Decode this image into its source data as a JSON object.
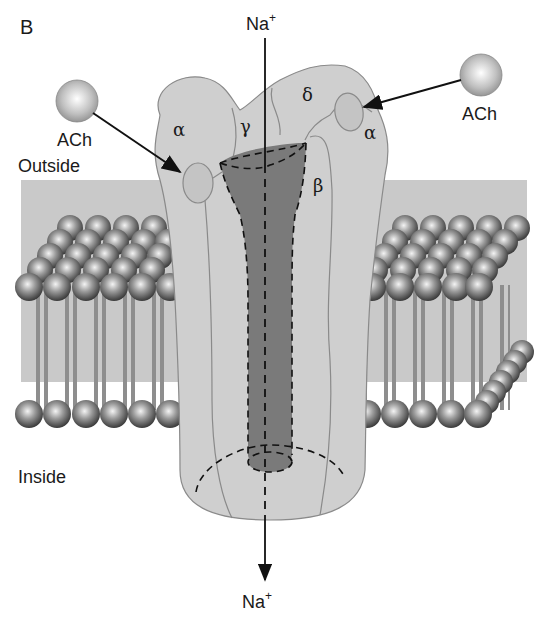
{
  "figure": {
    "panel_label": "B",
    "ion_top": {
      "base": "Na",
      "charge": "+"
    },
    "ion_bottom": {
      "base": "Na",
      "charge": "+"
    },
    "ligand_left": "ACh",
    "ligand_right": "ACh",
    "region_outside": "Outside",
    "region_inside": "Inside"
  },
  "subunits": {
    "alpha_left": "α",
    "gamma": "γ",
    "delta": "δ",
    "alpha_right": "α",
    "beta": "β"
  },
  "colors": {
    "membrane_bg": "#c8c8c8",
    "receptor_fill": "#cfcfcf",
    "pore_fill": "#7a7a7a",
    "outline": "#8a8a8a",
    "text": "#1a1a1a"
  }
}
